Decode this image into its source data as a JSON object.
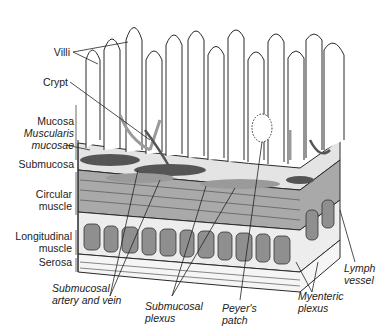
{
  "colors": {
    "outline": "#2a2a2a",
    "vessel_dark": "#555555",
    "vessel_light": "#9a9a9a",
    "muscle_fill": "#a8a8a8",
    "submucosa_fill": "#e2e2e2",
    "background": "#ffffff"
  },
  "labels": {
    "villi": "Villi",
    "crypt": "Crypt",
    "mucosa": "Mucosa",
    "muscularis_1": "Muscularis",
    "muscularis_2": "mucosae",
    "submucosa": "Submucosa",
    "circular_1": "Circular",
    "circular_2": "muscle",
    "longitudinal_1": "Longitudinal",
    "longitudinal_2": "muscle",
    "serosa": "Serosa",
    "sub_artery_1": "Submucosal",
    "sub_artery_2": "artery and vein",
    "sub_plexus_1": "Submucosal",
    "sub_plexus_2": "plexus",
    "peyer_1": "Peyer's",
    "peyer_2": "patch",
    "myenteric_1": "Myenteric",
    "myenteric_2": "plexus",
    "lymph_1": "Lymph",
    "lymph_2": "vessel"
  }
}
